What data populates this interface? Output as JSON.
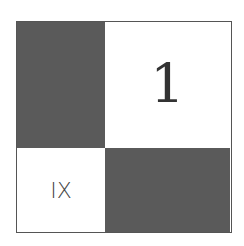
{
  "board": {
    "top_right_label": "1",
    "bottom_left_label": "IX",
    "colors": {
      "dark": "#5a5a5a",
      "light": "#ffffff"
    }
  }
}
